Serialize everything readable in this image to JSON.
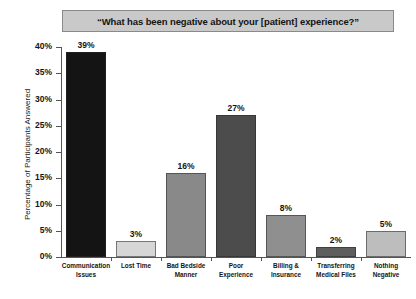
{
  "chart_data": {
    "type": "bar",
    "title": "“What has been negative about your [patient] experience?”",
    "xlabel": "",
    "ylabel": "Percentage of Participants Answered",
    "ylim": [
      0,
      40
    ],
    "grid": false,
    "legend": "none",
    "ytick_labels": [
      "40%",
      "35%",
      "30%",
      "25%",
      "20%",
      "15%",
      "10%",
      "5%",
      "0%"
    ],
    "ytick_values": [
      40,
      35,
      30,
      25,
      20,
      15,
      10,
      5,
      0
    ],
    "categories": [
      "Communication Issues",
      "Lost Time",
      "Bad Bedside Manner",
      "Poor Experience",
      "Billing & Insurance",
      "Transferring Medical Files",
      "Nothing Negative"
    ],
    "category_lines": [
      [
        "Communication",
        "Issues"
      ],
      [
        "Lost Time"
      ],
      [
        "Bad Bedside",
        "Manner"
      ],
      [
        "Poor",
        "Experience"
      ],
      [
        "Billing &",
        "Insurance"
      ],
      [
        "Transferring",
        "Medical Files"
      ],
      [
        "Nothing",
        "Negative"
      ]
    ],
    "values": [
      39,
      3,
      16,
      27,
      8,
      2,
      5
    ],
    "value_labels": [
      "39%",
      "3%",
      "16%",
      "27%",
      "8%",
      "2%",
      "5%"
    ],
    "bar_colors": [
      "#141414",
      "#d6d6d6",
      "#898989",
      "#4c4c4c",
      "#8f8f8f",
      "#5e5e5e",
      "#bdbdbd"
    ]
  },
  "style": {
    "title_background": "#c9c9c9",
    "title_border": "#8a8a8a",
    "axis_color": "#555555",
    "text_color": "#141414",
    "page_background": "#ffffff"
  }
}
